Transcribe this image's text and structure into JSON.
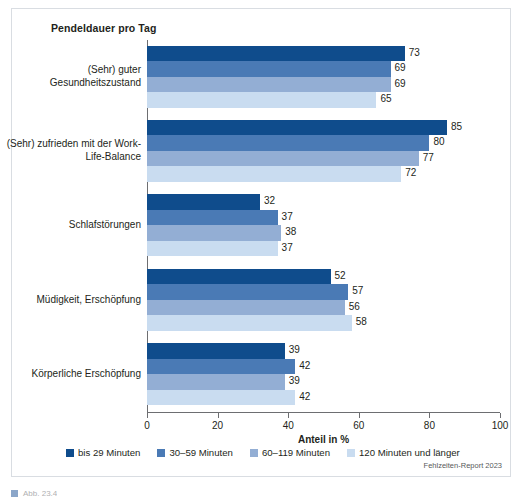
{
  "chart_data": {
    "type": "bar",
    "orientation": "horizontal",
    "title": "Pendeldauer pro Tag",
    "xlabel": "Anteil in %",
    "ylabel": "",
    "xlim": [
      0,
      100
    ],
    "xticks": [
      0,
      20,
      40,
      60,
      80,
      100
    ],
    "grid": false,
    "legend_position": "bottom",
    "categories": [
      "(Sehr) guter Gesundheitszustand",
      "(Sehr) zufrieden mit der Work-Life-Balance",
      "Schlafstörungen",
      "Müdigkeit, Erschöpfung",
      "Körperliche Erschöpfung"
    ],
    "category_lines": [
      [
        "(Sehr) guter",
        "Gesundheitszustand"
      ],
      [
        "(Sehr) zufrieden mit der Work-",
        "Life-Balance"
      ],
      [
        "Schlafstörungen"
      ],
      [
        "Müdigkeit, Erschöpfung"
      ],
      [
        "Körperliche Erschöpfung"
      ]
    ],
    "series": [
      {
        "name": "bis 29 Minuten",
        "color": "#0f4c8c",
        "values": [
          73,
          85,
          32,
          52,
          39
        ]
      },
      {
        "name": "30–59 Minuten",
        "color": "#4a7ab5",
        "values": [
          69,
          80,
          37,
          57,
          42
        ]
      },
      {
        "name": "60–119 Minuten",
        "color": "#93aed4",
        "values": [
          69,
          77,
          38,
          56,
          39
        ]
      },
      {
        "name": "120 Minuten und länger",
        "color": "#c9dcf0",
        "values": [
          65,
          72,
          37,
          58,
          42
        ]
      }
    ],
    "source": "Fehlzeiten-Report 2023"
  },
  "caption_sliver": {
    "text": "Abb. 23.4"
  }
}
